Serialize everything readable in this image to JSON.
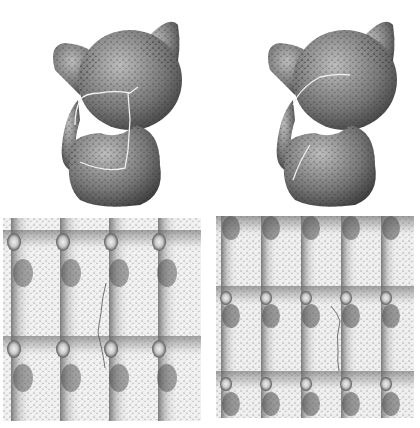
{
  "figure": {
    "panels": [
      {
        "id": "cat-left",
        "kind": "3d-mesh",
        "subject": "cat model with seam cut (long cut path)",
        "seam_color": "#e8e8e8"
      },
      {
        "id": "cat-right",
        "kind": "3d-mesh",
        "subject": "cat model with seam cut (short cut path)",
        "seam_color": "#e8e8e8"
      },
      {
        "id": "tile-left",
        "kind": "parameterization-tiling",
        "grid": {
          "cols": 4,
          "rows": 2
        }
      },
      {
        "id": "tile-right",
        "kind": "parameterization-tiling",
        "grid": {
          "cols": 5,
          "rows": 2.5
        }
      }
    ],
    "colors": {
      "background": "#ffffff",
      "mesh_dark": "#3a3a3a",
      "mesh_mid": "#8a8a8a",
      "mesh_light": "#d8d8d8"
    }
  }
}
